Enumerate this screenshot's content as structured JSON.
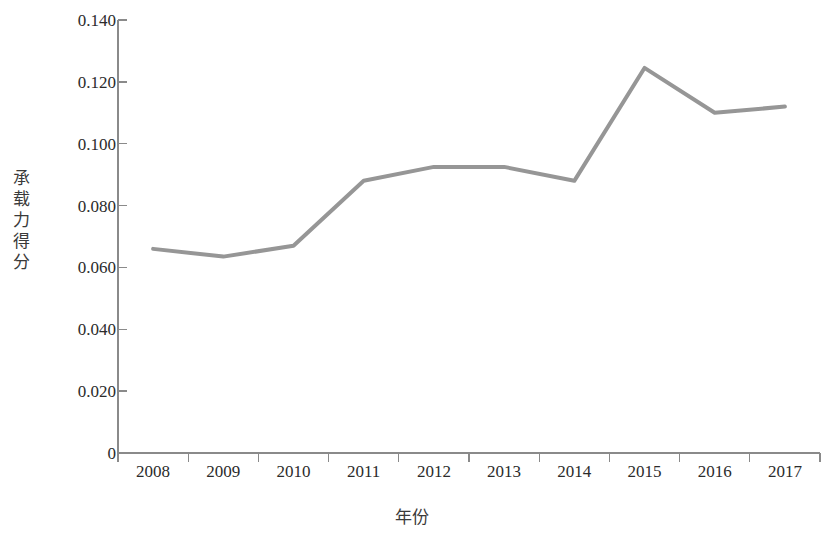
{
  "chart_data": {
    "type": "line",
    "title": "",
    "subtitle": "",
    "xlabel": "年份",
    "ylabel": "承载力得分",
    "ylabel_vertical_glyphs": "承\n载\n力\n得\n分",
    "categories": [
      "2008",
      "2009",
      "2010",
      "2011",
      "2012",
      "2013",
      "2014",
      "2015",
      "2016",
      "2017"
    ],
    "x": [
      2008,
      2009,
      2010,
      2011,
      2012,
      2013,
      2014,
      2015,
      2016,
      2017
    ],
    "values": [
      0.066,
      0.0635,
      0.067,
      0.088,
      0.0925,
      0.0925,
      0.088,
      0.1245,
      0.11,
      0.112
    ],
    "series": [
      {
        "name": "承载力得分",
        "values": [
          0.066,
          0.0635,
          0.067,
          0.088,
          0.0925,
          0.0925,
          0.088,
          0.1245,
          0.11,
          0.112
        ],
        "color": "#969696",
        "line_width": 4,
        "markers": "none"
      }
    ],
    "ylim": [
      0,
      0.14
    ],
    "ytick_values": [
      0.14,
      0.12,
      0.1,
      0.08,
      0.06,
      0.04,
      0.02,
      0
    ],
    "ytick_labels": [
      "0.140",
      "0.120",
      "0.100",
      "0.080",
      "0.060",
      "0.040",
      "0.020",
      "0"
    ],
    "xtick_labels": [
      "2008",
      "2009",
      "2010",
      "2011",
      "2012",
      "2013",
      "2014",
      "2015",
      "2016",
      "2017"
    ],
    "grid": false,
    "legend": "none",
    "axis_color": "#8a8a8a",
    "text_color": "#2b2b2b"
  }
}
